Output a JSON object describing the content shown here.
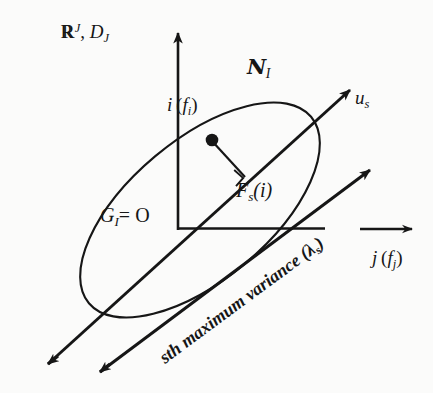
{
  "figure": {
    "background_color": "#fbfbfa",
    "stroke_color": "#161616"
  },
  "labels": {
    "space": {
      "base": "R",
      "superscript": "J",
      "separator": ", ",
      "cloud": "D",
      "cloud_subscript": "J",
      "text": "R^J, D_J"
    },
    "manifold": {
      "symbol": "N",
      "subscript": "I",
      "text": "N_I"
    },
    "axis_us": {
      "base": "u",
      "subscript": "s",
      "text": "u_s"
    },
    "axis_i": {
      "base": "i",
      "paren_open": "(",
      "inner": "f",
      "inner_subscript": "i",
      "paren_close": ")",
      "text": "i (f_i)"
    },
    "projection": {
      "base": "F",
      "subscript": "s",
      "arg": "(i)",
      "text": "F_s(i)"
    },
    "origin": {
      "base": "G",
      "subscript": "I",
      "equals": "= O",
      "text": "G_I = O"
    },
    "axis_j": {
      "base": "j",
      "paren_open": "(",
      "inner": "f",
      "inner_subscript": "j",
      "paren_close": ")",
      "text": "j (f_j)"
    },
    "variance": {
      "prefix": "sth maximum variance (",
      "lambda": "λ",
      "lambda_subscript": "s",
      "suffix": ")",
      "text": "sth maximum variance (λ_s)"
    }
  },
  "geometry": {
    "origin": {
      "x": 178,
      "y": 228
    },
    "vertical_axis": {
      "x1": 178,
      "y1": 228,
      "x2": 178,
      "y2": 30,
      "arrow": "up"
    },
    "horizontal_axis": {
      "x1": 178,
      "y1": 228,
      "x2": 323,
      "y2": 228,
      "arrow": "none"
    },
    "principal_axis_us": {
      "x1": 42,
      "y1": 370,
      "x2": 352,
      "y2": 88,
      "arrow": "up-right"
    },
    "depth_axis": {
      "x1": 100,
      "y1": 372,
      "x2": 372,
      "y2": 168,
      "arrow": "up-right"
    },
    "back_axis": {
      "x1": 55,
      "y1": 373,
      "x2": 250,
      "y2": 228,
      "arrow": "down-left"
    },
    "j_arrow": {
      "x1": 358,
      "y1": 229,
      "x2": 413,
      "y2": 229,
      "arrow": "right"
    },
    "ellipse": {
      "cx": 200,
      "cy": 210,
      "rx": 145,
      "ry": 70,
      "rotation_deg": -40
    },
    "point_i": {
      "x": 212,
      "y": 140,
      "radius": 6
    },
    "projection_segment": {
      "x1": 212,
      "y1": 140,
      "x2": 243,
      "y2": 175
    },
    "right_angle_marker": {
      "x": 243,
      "y": 175,
      "size": 11
    }
  }
}
